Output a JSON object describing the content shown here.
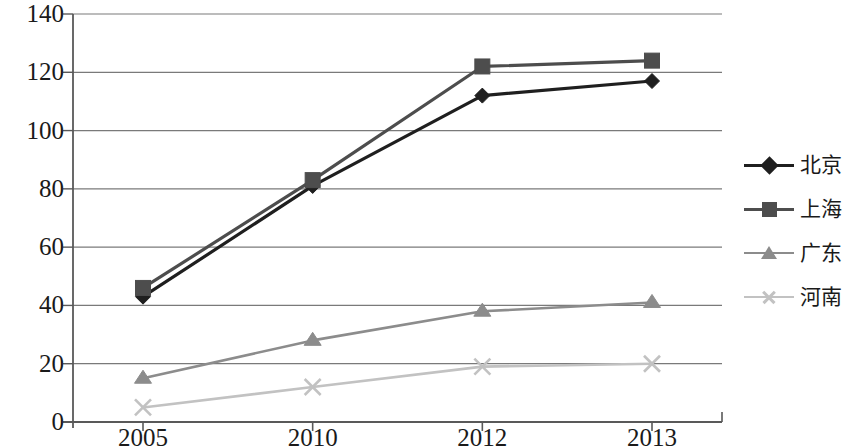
{
  "chart_data": {
    "type": "line",
    "title": "",
    "subtitle": "",
    "xlabel": "",
    "ylabel": "",
    "categories": [
      "2005",
      "2010",
      "2012",
      "2013"
    ],
    "ylim": [
      0,
      140
    ],
    "yticks": [
      0,
      20,
      40,
      60,
      80,
      100,
      120,
      140
    ],
    "grid": true,
    "legend_position": "right",
    "series": [
      {
        "name": "北京",
        "marker": "diamond",
        "color": "#1f1f1f",
        "line_style": "solid",
        "values": [
          43,
          81,
          112,
          117
        ]
      },
      {
        "name": "上海",
        "marker": "square",
        "color": "#4d4d4d",
        "line_style": "solid",
        "values": [
          46,
          83,
          122,
          124
        ]
      },
      {
        "name": "广东",
        "marker": "triangle",
        "color": "#8c8c8c",
        "line_style": "solid",
        "values": [
          15,
          28,
          38,
          41
        ]
      },
      {
        "name": "河南",
        "marker": "cross",
        "color": "#c2c2c2",
        "line_style": "solid",
        "values": [
          5,
          12,
          19,
          20
        ]
      }
    ]
  },
  "axes": {
    "y_tick_labels": [
      "140",
      "120",
      "100",
      "80",
      "60",
      "40",
      "20",
      "0"
    ],
    "x_tick_labels": [
      "2005",
      "2010",
      "2012",
      "2013"
    ],
    "axis_color": "#595959",
    "grid_color": "#7a7a7a"
  },
  "legend": {
    "items": [
      {
        "label": "北京"
      },
      {
        "label": "上海"
      },
      {
        "label": "广东"
      },
      {
        "label": "河南"
      }
    ]
  }
}
